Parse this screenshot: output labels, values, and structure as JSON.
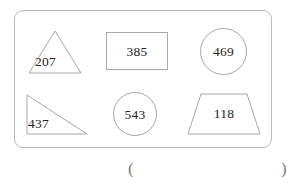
{
  "worksheet": {
    "panel": {
      "name": "shapes-panel",
      "border_color": "#b9b9b9"
    },
    "shapes": [
      {
        "id": "triangle-207",
        "kind": "triangle",
        "value": "207"
      },
      {
        "id": "rectangle-385",
        "kind": "rectangle",
        "value": "385"
      },
      {
        "id": "circle-469",
        "kind": "circle",
        "value": "469"
      },
      {
        "id": "right-triangle-437",
        "kind": "right-triangle",
        "value": "437"
      },
      {
        "id": "circle-543",
        "kind": "circle",
        "value": "543"
      },
      {
        "id": "trapezoid-118",
        "kind": "trapezoid",
        "value": "118"
      }
    ],
    "answer_blank": {
      "open_paren": "(",
      "close_paren": ")",
      "value": ""
    },
    "colors": {
      "shape_stroke": "#a8a8a8",
      "panel_stroke": "#b9b9b9",
      "text": "#232323",
      "paren": "#7d7d7d",
      "background": "#ffffff"
    }
  }
}
